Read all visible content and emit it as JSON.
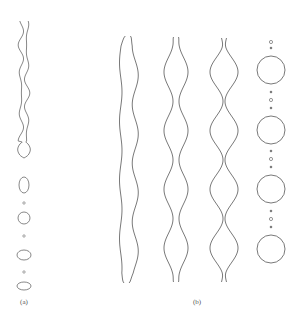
{
  "figure": {
    "stroke_color": "#6a6a6a",
    "panels": [
      {
        "id": "a",
        "label": "(a)",
        "label_pos": [
          24,
          298
        ],
        "jet": {
          "cx": 24,
          "top": 21,
          "bottom": 158,
          "description": "thin wavy jet ending in a tear-drop bulb"
        },
        "drops": [
          {
            "cx": 24,
            "cy": 185,
            "rx": 5,
            "ry": 8
          },
          {
            "cx": 24,
            "cy": 218,
            "rx": 6,
            "ry": 6
          },
          {
            "cx": 24,
            "cy": 255,
            "rx": 7,
            "ry": 5
          },
          {
            "cx": 24,
            "cy": 286,
            "rx": 7,
            "ry": 4
          }
        ],
        "satellites": [
          {
            "cx": 24,
            "cy": 203,
            "r": 1.2
          },
          {
            "cx": 24,
            "cy": 236,
            "r": 1.2
          },
          {
            "cx": 24,
            "cy": 272,
            "r": 1.2
          }
        ]
      },
      {
        "id": "b",
        "label": "(b)",
        "label_pos": [
          197,
          298
        ],
        "jets": [
          {
            "cx": 128,
            "top": 36,
            "bottom": 283,
            "bulge": 9,
            "neck": 5.5,
            "stage": "early"
          },
          {
            "cx": 176,
            "top": 37,
            "bottom": 282,
            "bulge": 12,
            "neck": 3,
            "stage": "intermediate"
          },
          {
            "cx": 224,
            "top": 38,
            "bottom": 282,
            "bulge": 14,
            "neck": 1,
            "stage": "near-breakup"
          }
        ],
        "bulge_centers": [
          72,
          130,
          190,
          248
        ],
        "drops": [
          {
            "cx": 271,
            "cy": 70,
            "r": 14
          },
          {
            "cx": 271,
            "cy": 130,
            "r": 14
          },
          {
            "cx": 271,
            "cy": 189,
            "r": 14
          },
          {
            "cx": 271,
            "cy": 249,
            "r": 14
          }
        ],
        "satellites": [
          {
            "cx": 271,
            "cy": 42,
            "r": 1.6,
            "type": "ring"
          },
          {
            "cx": 271,
            "cy": 48,
            "r": 0.9,
            "type": "dot"
          },
          {
            "cx": 271,
            "cy": 92,
            "r": 0.9,
            "type": "dot"
          },
          {
            "cx": 271,
            "cy": 100,
            "r": 1.6,
            "type": "ring"
          },
          {
            "cx": 271,
            "cy": 108,
            "r": 0.9,
            "type": "dot"
          },
          {
            "cx": 271,
            "cy": 151,
            "r": 0.9,
            "type": "dot"
          },
          {
            "cx": 271,
            "cy": 159,
            "r": 1.6,
            "type": "ring"
          },
          {
            "cx": 271,
            "cy": 167,
            "r": 0.9,
            "type": "dot"
          },
          {
            "cx": 271,
            "cy": 211,
            "r": 0.9,
            "type": "dot"
          },
          {
            "cx": 271,
            "cy": 219,
            "r": 1.6,
            "type": "ring"
          },
          {
            "cx": 271,
            "cy": 227,
            "r": 0.9,
            "type": "dot"
          }
        ]
      }
    ]
  }
}
